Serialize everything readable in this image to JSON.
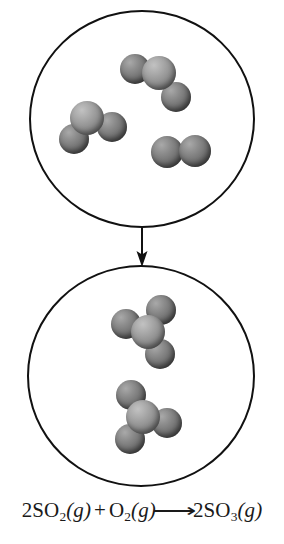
{
  "diagram": {
    "type": "particulate-reaction-diagram",
    "background_color": "#ffffff",
    "outline_color": "#111111",
    "atom_colors": {
      "sulfur": "#939393",
      "oxygen": "#757575"
    },
    "vessels": [
      {
        "id": "reactants",
        "label": "reactant vessel",
        "molecule_count": 3,
        "molecules": [
          {
            "name": "sulfur-dioxide-molecule",
            "formula": "SO2",
            "geometry": "bent",
            "atom_count": 3,
            "center_x": 159,
            "center_y": 73,
            "atoms": [
              {
                "element": "S",
                "dx": 0,
                "dy": 0,
                "r": 17
              },
              {
                "element": "O",
                "dx": -24,
                "dy": -4,
                "r": 15
              },
              {
                "element": "O",
                "dx": 17,
                "dy": 24,
                "r": 15
              }
            ]
          },
          {
            "name": "sulfur-dioxide-molecule",
            "formula": "SO2",
            "geometry": "bent",
            "atom_count": 3,
            "center_x": 87,
            "center_y": 118,
            "atoms": [
              {
                "element": "S",
                "dx": 0,
                "dy": 0,
                "r": 17
              },
              {
                "element": "O",
                "dx": -13,
                "dy": 21,
                "r": 15
              },
              {
                "element": "O",
                "dx": 25,
                "dy": 9,
                "r": 15
              }
            ]
          },
          {
            "name": "oxygen-molecule",
            "formula": "O2",
            "geometry": "linear",
            "atom_count": 2,
            "center_x": 181,
            "center_y": 152,
            "atoms": [
              {
                "element": "O",
                "dx": -14,
                "dy": 0,
                "r": 16
              },
              {
                "element": "O",
                "dx": 14,
                "dy": -1,
                "r": 16
              }
            ]
          }
        ]
      },
      {
        "id": "products",
        "label": "product vessel",
        "molecule_count": 2,
        "molecules": [
          {
            "name": "sulfur-trioxide-molecule",
            "formula": "SO3",
            "geometry": "trigonal-planar",
            "atom_count": 4,
            "center_x": 148,
            "center_y": 332,
            "atoms": [
              {
                "element": "S",
                "dx": 0,
                "dy": 0,
                "r": 17
              },
              {
                "element": "O",
                "dx": -22,
                "dy": -8,
                "r": 15
              },
              {
                "element": "O",
                "dx": 13,
                "dy": -22,
                "r": 15
              },
              {
                "element": "O",
                "dx": 12,
                "dy": 22,
                "r": 15
              }
            ]
          },
          {
            "name": "sulfur-trioxide-molecule",
            "formula": "SO3",
            "geometry": "trigonal-planar",
            "atom_count": 4,
            "center_x": 143,
            "center_y": 417,
            "atoms": [
              {
                "element": "S",
                "dx": 0,
                "dy": 0,
                "r": 17
              },
              {
                "element": "O",
                "dx": -12,
                "dy": -22,
                "r": 15
              },
              {
                "element": "O",
                "dx": -13,
                "dy": 22,
                "r": 15
              },
              {
                "element": "O",
                "dx": 24,
                "dy": 6,
                "r": 15
              }
            ]
          }
        ]
      }
    ],
    "arrow": {
      "name": "reaction-progress-arrow",
      "direction": "down",
      "x": 142,
      "y_start": 228,
      "y_end": 266
    }
  },
  "equation": {
    "full_text": "2SO2(g) + O2(g) ⟶ 2SO3(g)",
    "reactant_1_coefficient": "2",
    "reactant_1_formula": "SO",
    "reactant_1_subscript": "2",
    "reactant_1_state": "(g)",
    "plus": "+",
    "reactant_2_formula": "O",
    "reactant_2_subscript": "2",
    "reactant_2_state": "(g)",
    "arrow_glyph": "⟶",
    "product_coefficient": "2",
    "product_formula": "SO",
    "product_subscript": "3",
    "product_state": "(g)"
  }
}
